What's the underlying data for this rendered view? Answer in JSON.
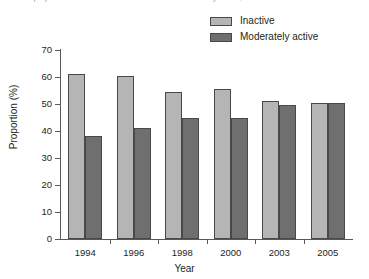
{
  "caption": {
    "text": "trends in proportions of adults who were inactive or moderately active, 1994-2005"
  },
  "legend": {
    "position": "top-right",
    "entries": [
      {
        "label": "Inactive",
        "color": "#b5b5b5"
      },
      {
        "label": "Moderately active",
        "color": "#6f6f6f"
      }
    ]
  },
  "axes": {
    "y_title": "Proportion (%)",
    "x_title": "Year",
    "y_ticks": [
      "0",
      "10",
      "20",
      "30",
      "40",
      "50",
      "60",
      "70"
    ],
    "x_ticks": [
      "1994",
      "1996",
      "1998",
      "2000",
      "2003",
      "2005"
    ]
  },
  "chart_data": {
    "type": "bar",
    "title": "",
    "subtitle": "",
    "xlabel": "Year",
    "ylabel": "Proportion (%)",
    "categories": [
      "1994",
      "1996",
      "1998",
      "2000",
      "2003",
      "2005"
    ],
    "series": [
      {
        "name": "Inactive",
        "color": "#b5b5b5",
        "values": [
          61,
          60.5,
          54.5,
          55.5,
          51,
          50.5
        ]
      },
      {
        "name": "Moderately active",
        "color": "#6f6f6f",
        "values": [
          38,
          41,
          45,
          45,
          49.5,
          50.5
        ]
      }
    ],
    "ylim": [
      0,
      70
    ],
    "ytick_step": 10,
    "grid": false,
    "legend_position": "top-right"
  }
}
